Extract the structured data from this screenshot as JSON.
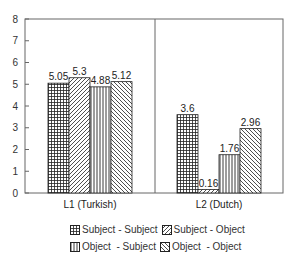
{
  "chart_data": {
    "type": "bar",
    "title": "",
    "xlabel": "",
    "ylabel": "",
    "ylim": [
      0,
      8
    ],
    "yticks": [
      0,
      1,
      2,
      3,
      4,
      5,
      6,
      7,
      8
    ],
    "categories": [
      "L1 (Turkish)",
      "L2 (Dutch)"
    ],
    "series": [
      {
        "name": "Subject - Subject",
        "pattern": "grid",
        "values": [
          5.05,
          3.6
        ]
      },
      {
        "name": "Subject - Object",
        "pattern": "diag-up",
        "values": [
          5.3,
          0.16
        ]
      },
      {
        "name": "Object  - Subject",
        "pattern": "vertical",
        "values": [
          4.88,
          1.76
        ]
      },
      {
        "name": "Object  - Object",
        "pattern": "diag-down",
        "values": [
          5.12,
          2.96
        ]
      }
    ],
    "value_labels": [
      [
        "5.05",
        "5.3",
        "4.88",
        "5.12"
      ],
      [
        "3.6",
        "0.16",
        "1.76",
        "2.96"
      ]
    ],
    "legend_position": "bottom",
    "grid": false
  },
  "legend": {
    "items": [
      {
        "label": "Subject - Subject"
      },
      {
        "label": "Subject - Object"
      },
      {
        "label": "Object  - Subject"
      },
      {
        "label": "Object  - Object"
      }
    ]
  },
  "colors": {
    "axis": "#666666",
    "bar_stroke": "#222222",
    "text": "#333333"
  }
}
